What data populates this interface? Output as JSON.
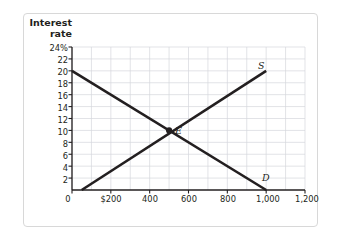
{
  "chart_data": {
    "type": "line",
    "title": "",
    "xlabel": "Quantity of loanable funds (billions of dollars)",
    "ylabel": "Interest\nrate",
    "xlim": [
      0,
      1200
    ],
    "ylim": [
      0,
      24
    ],
    "grid": true,
    "legend": "none",
    "xticks": [
      "0",
      "$200",
      "400",
      "600",
      "800",
      "1,000",
      "1,200"
    ],
    "xtick_values": [
      0,
      200,
      400,
      600,
      800,
      1000,
      1200
    ],
    "yticks": [
      "24%",
      "22",
      "20",
      "18",
      "16",
      "14",
      "12",
      "10",
      "8",
      "6",
      "4",
      "2"
    ],
    "ytick_values": [
      24,
      22,
      20,
      18,
      16,
      14,
      12,
      10,
      8,
      6,
      4,
      2
    ],
    "series": [
      {
        "name": "D",
        "label": "D",
        "x": [
          0,
          1000
        ],
        "y": [
          20,
          0
        ],
        "color": "#231f20"
      },
      {
        "name": "S",
        "label": "S",
        "x": [
          50,
          1000
        ],
        "y": [
          0,
          20
        ],
        "color": "#231f20"
      }
    ],
    "annotations": [
      {
        "name": "equilibrium-point",
        "label": "E",
        "x": 500,
        "y": 10
      }
    ]
  },
  "labels": {
    "y_axis_line1": "Interest",
    "y_axis_line2": "rate",
    "x_axis_title": "Quantity of loanable funds (billions of dollars)",
    "supply_curve": "S",
    "demand_curve": "D",
    "equilibrium": "E"
  },
  "colors": {
    "curve": "#231f20",
    "grid": "#d5d7dd",
    "axis": "#231f20",
    "frame": "#d8d8d8",
    "text": "#231f20",
    "background": "#ffffff"
  }
}
